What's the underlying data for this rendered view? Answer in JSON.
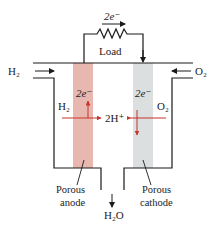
{
  "diagram": {
    "type": "hydrogen-fuel-cell",
    "labels": {
      "top_electrons": "2e⁻",
      "load": "Load",
      "h2_inlet": "H₂",
      "o2_inlet": "O₂",
      "h2_inside": "H₂",
      "o2_inside": "O₂",
      "anode_electrons": "2e⁻",
      "cathode_electrons": "2e⁻",
      "protons": "2H⁺",
      "anode_line1": "Porous",
      "anode_line2": "anode",
      "cathode_line1": "Porous",
      "cathode_line2": "cathode",
      "water": "H₂O"
    },
    "colors": {
      "anode_fill": "#e8b8b0",
      "cathode_fill": "#dcdfe0",
      "arrow_red": "#c8332b",
      "line": "#1a1a1a"
    }
  }
}
